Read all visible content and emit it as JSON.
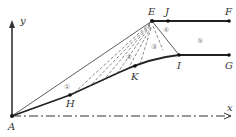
{
  "diagram": {
    "colors": {
      "stroke": "#222222",
      "dashed": "#555555",
      "label": "#333333",
      "region": "#777777"
    },
    "axes": {
      "x_label": "x",
      "y_label": "y"
    },
    "points": {
      "A": "A",
      "E": "E",
      "J": "J",
      "F": "F",
      "H": "H",
      "K": "K",
      "I": "I",
      "G": "G"
    },
    "regions": [
      "①",
      "②",
      "③",
      "④",
      "⑤"
    ]
  }
}
